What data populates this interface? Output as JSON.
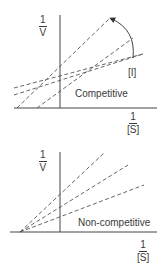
{
  "diagram": {
    "colors": {
      "axis": "#444444",
      "line": "#555555",
      "text": "#3a3a3a"
    },
    "panels": [
      {
        "name": "competitive",
        "label": "Competitive",
        "y_axis_label": {
          "numerator": "1",
          "denominator": "V"
        },
        "x_axis_label": {
          "numerator": "1",
          "denominator": "[S]"
        },
        "arrow_label": "[I]",
        "description": "Dashed lines intersect on the 1/V axis; slope increases with increasing [I]"
      },
      {
        "name": "non-competitive",
        "label": "Non-competitive",
        "y_axis_label": {
          "numerator": "1",
          "denominator": "V"
        },
        "x_axis_label": {
          "numerator": "1",
          "denominator": "[S]"
        },
        "description": "Dashed lines intersect on the 1/[S] axis (left of origin); slope increases with inhibitor"
      }
    ]
  }
}
